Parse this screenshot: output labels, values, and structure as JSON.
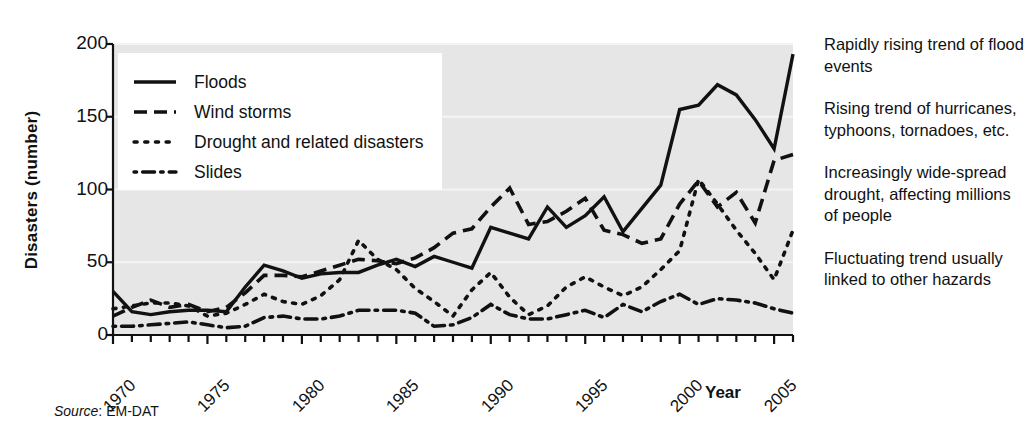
{
  "chart_data": {
    "type": "line",
    "title": "",
    "xlabel": "Year",
    "ylabel": "Disasters (number)",
    "xlim": [
      1970,
      2006
    ],
    "ylim": [
      0,
      200
    ],
    "yticks": [
      0,
      50,
      100,
      150,
      200
    ],
    "xticks": [
      1970,
      1975,
      1980,
      1985,
      1990,
      1995,
      2000,
      2005
    ],
    "grid": "horizontal",
    "legend_position": "top-left",
    "x": [
      1970,
      1971,
      1972,
      1973,
      1974,
      1975,
      1976,
      1977,
      1978,
      1979,
      1980,
      1981,
      1982,
      1983,
      1984,
      1985,
      1986,
      1987,
      1988,
      1989,
      1990,
      1991,
      1992,
      1993,
      1994,
      1995,
      1996,
      1997,
      1998,
      1999,
      2000,
      2001,
      2002,
      2003,
      2004,
      2005,
      2006
    ],
    "series": [
      {
        "name": "Floods",
        "style": "solid",
        "values": [
          30,
          16,
          14,
          16,
          17,
          17,
          16,
          33,
          48,
          44,
          39,
          42,
          43,
          43,
          48,
          52,
          47,
          54,
          50,
          46,
          74,
          70,
          66,
          88,
          74,
          82,
          95,
          71,
          87,
          103,
          155,
          158,
          172,
          165,
          148,
          128,
          193
        ]
      },
      {
        "name": "Wind storms",
        "style": "dashed",
        "values": [
          13,
          19,
          24,
          19,
          21,
          16,
          19,
          29,
          41,
          41,
          40,
          44,
          48,
          52,
          51,
          49,
          53,
          60,
          70,
          73,
          88,
          101,
          76,
          78,
          85,
          94,
          72,
          69,
          63,
          66,
          90,
          106,
          88,
          98,
          77,
          120,
          124
        ]
      },
      {
        "name": "Drought and related disasters",
        "style": "dotted",
        "values": [
          18,
          20,
          22,
          22,
          20,
          13,
          15,
          21,
          28,
          23,
          21,
          27,
          38,
          65,
          52,
          45,
          32,
          23,
          13,
          31,
          43,
          26,
          14,
          20,
          33,
          40,
          33,
          27,
          33,
          45,
          58,
          107,
          90,
          72,
          56,
          38,
          72
        ]
      },
      {
        "name": "Slides",
        "style": "dashdot",
        "values": [
          6,
          6,
          7,
          8,
          9,
          7,
          5,
          6,
          12,
          13,
          11,
          11,
          13,
          17,
          17,
          17,
          15,
          6,
          7,
          12,
          21,
          14,
          11,
          11,
          14,
          17,
          12,
          21,
          16,
          23,
          28,
          21,
          25,
          24,
          22,
          18,
          15
        ]
      }
    ]
  },
  "axes": {
    "ylabel": "Disasters (number)",
    "xlabel": "Year",
    "ytick_labels": [
      "200",
      "150",
      "100",
      "50",
      "0"
    ],
    "xtick_labels": [
      "1970",
      "1975",
      "1980",
      "1985",
      "1990",
      "1995",
      "2000",
      "2005"
    ]
  },
  "legend": {
    "items": [
      {
        "label": "Floods",
        "key": "solid-line-key"
      },
      {
        "label": "Wind storms",
        "key": "dashed-line-key"
      },
      {
        "label": "Drought and related disasters",
        "key": "dotted-line-key"
      },
      {
        "label": "Slides",
        "key": "dashdot-line-key"
      }
    ]
  },
  "annotations": [
    "Rapidly rising trend of flood events",
    "Rising trend of hurricanes, typhoons, tornadoes, etc.",
    "Increasingly wide-spread drought, affecting millions of people",
    "Fluctuating trend usually linked to other hazards"
  ],
  "source": {
    "label": "Source",
    "separator": ": ",
    "value": "EM-DAT"
  },
  "colors": {
    "plot_background": "#e6e6e6",
    "ink": "#111111",
    "gridline": "#f4f4f4",
    "page_background": "#ffffff"
  }
}
